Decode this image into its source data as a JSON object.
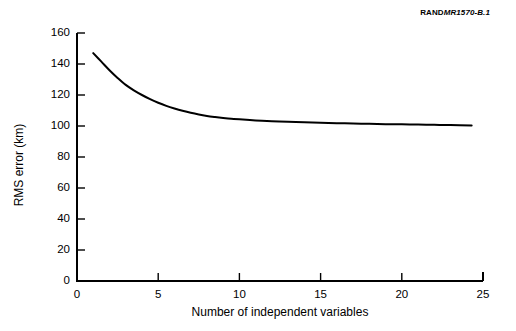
{
  "credit": {
    "rand": "RAND",
    "report_id": "MR1570-B.1"
  },
  "chart_data": {
    "type": "line",
    "title": "",
    "subtitle": "",
    "xlabel": "Number of independent variables",
    "ylabel": "RMS error (km)",
    "xlim": [
      0,
      25
    ],
    "ylim": [
      0,
      160
    ],
    "xticks": [
      0,
      5,
      10,
      15,
      20,
      25
    ],
    "xtick_labels": [
      "0",
      "5",
      "10",
      "15",
      "20",
      "25"
    ],
    "yticks": [
      0,
      20,
      40,
      60,
      80,
      100,
      120,
      140,
      160
    ],
    "ytick_labels": [
      "0",
      "20",
      "40",
      "60",
      "80",
      "100",
      "120",
      "140",
      "160"
    ],
    "grid": false,
    "legend": false,
    "legend_position": "none",
    "line_color": "#000000",
    "line_width": 2,
    "series": [
      {
        "name": "RMS error",
        "x": [
          1,
          1.5,
          2,
          2.5,
          3,
          3.5,
          4,
          4.5,
          5,
          5.5,
          6,
          6.5,
          7,
          7.5,
          8,
          8.5,
          9,
          9.5,
          10,
          11,
          12,
          13,
          14,
          15,
          16,
          17,
          18,
          19,
          20,
          21,
          22,
          23,
          24.3
        ],
        "y": [
          147,
          141.5,
          136,
          131,
          126.5,
          123,
          120,
          117.3,
          115,
          113,
          111.3,
          109.8,
          108.5,
          107.4,
          106.5,
          105.8,
          105.2,
          104.7,
          104.3,
          103.6,
          103.1,
          102.7,
          102.4,
          102.1,
          101.8,
          101.6,
          101.4,
          101.2,
          101.05,
          100.9,
          100.75,
          100.6,
          100.4
        ]
      }
    ],
    "annotations": []
  },
  "axis": {
    "y_ticks_render": [
      {
        "label": "160",
        "value": 160
      },
      {
        "label": "140",
        "value": 140
      },
      {
        "label": "120",
        "value": 120
      },
      {
        "label": "100",
        "value": 100
      },
      {
        "label": "80",
        "value": 80
      },
      {
        "label": "60",
        "value": 60
      },
      {
        "label": "40",
        "value": 40
      },
      {
        "label": "20",
        "value": 20
      },
      {
        "label": "0",
        "value": 0
      }
    ],
    "x_ticks_render": [
      {
        "label": "0",
        "value": 0
      },
      {
        "label": "5",
        "value": 5
      },
      {
        "label": "10",
        "value": 10
      },
      {
        "label": "15",
        "value": 15
      },
      {
        "label": "20",
        "value": 20
      },
      {
        "label": "25",
        "value": 25
      }
    ]
  }
}
